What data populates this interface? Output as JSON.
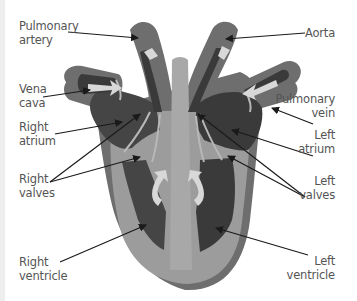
{
  "diagram": {
    "colors": {
      "outer_wall": "#6e6e6e",
      "muscle": "#9c9c9c",
      "chamber": "#454545",
      "valve": "#b8b8b8",
      "arrow": "#d8d8d8",
      "label_text": "#555555",
      "pointer": "#1a1a1a"
    },
    "labels": {
      "pulmonary_artery": {
        "line1": "Pulmonary",
        "line2": "artery"
      },
      "aorta": {
        "line1": "Aorta"
      },
      "vena_cava": {
        "line1": "Vena",
        "line2": "cava"
      },
      "pulmonary_vein": {
        "line1": "Pulmonary",
        "line2": "vein"
      },
      "right_atrium": {
        "line1": "Right",
        "line2": "atrium"
      },
      "left_atrium": {
        "line1": "Left",
        "line2": "atrium"
      },
      "right_valves": {
        "line1": "Right",
        "line2": "valves"
      },
      "left_valves": {
        "line1": "Left",
        "line2": "valves"
      },
      "right_ventricle": {
        "line1": "Right",
        "line2": "ventricle"
      },
      "left_ventricle": {
        "line1": "Left",
        "line2": "ventricle"
      }
    }
  }
}
